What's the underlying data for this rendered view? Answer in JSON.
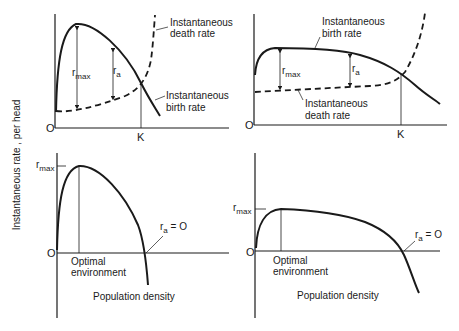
{
  "y_axis_label": "Instantaneous rate , per head",
  "panels": {
    "top_left": {
      "origin": "O",
      "k_label": "K",
      "death_label_1": "Instantaneous",
      "death_label_2": "death rate",
      "birth_label_1": "Instantaneous",
      "birth_label_2": "birth rate",
      "rmax": "r",
      "rmax_sub": "max",
      "ra": "r",
      "ra_sub": "a"
    },
    "top_right": {
      "origin": "O",
      "k_label": "K",
      "birth_label_1": "Instantaneous",
      "birth_label_2": "birth rate",
      "death_label_1": "Instantaneous",
      "death_label_2": "death rate",
      "rmax": "r",
      "rmax_sub": "max",
      "ra": "r",
      "ra_sub": "a"
    },
    "bottom_left": {
      "origin": "O",
      "rmax": "r",
      "rmax_sub": "max",
      "ra": "r",
      "ra_sub": "a",
      "ra_eq": " = O",
      "optimal_1": "Optimal",
      "optimal_2": "environment",
      "x_label": "Population density"
    },
    "bottom_right": {
      "origin": "O",
      "rmax": "r",
      "rmax_sub": "max",
      "ra": "r",
      "ra_sub": "a",
      "ra_eq": " = O",
      "optimal_1": "Optimal",
      "optimal_2": "environment",
      "x_label": "Population density"
    }
  },
  "colors": {
    "ink": "#1a1a1a",
    "background": "#ffffff"
  }
}
